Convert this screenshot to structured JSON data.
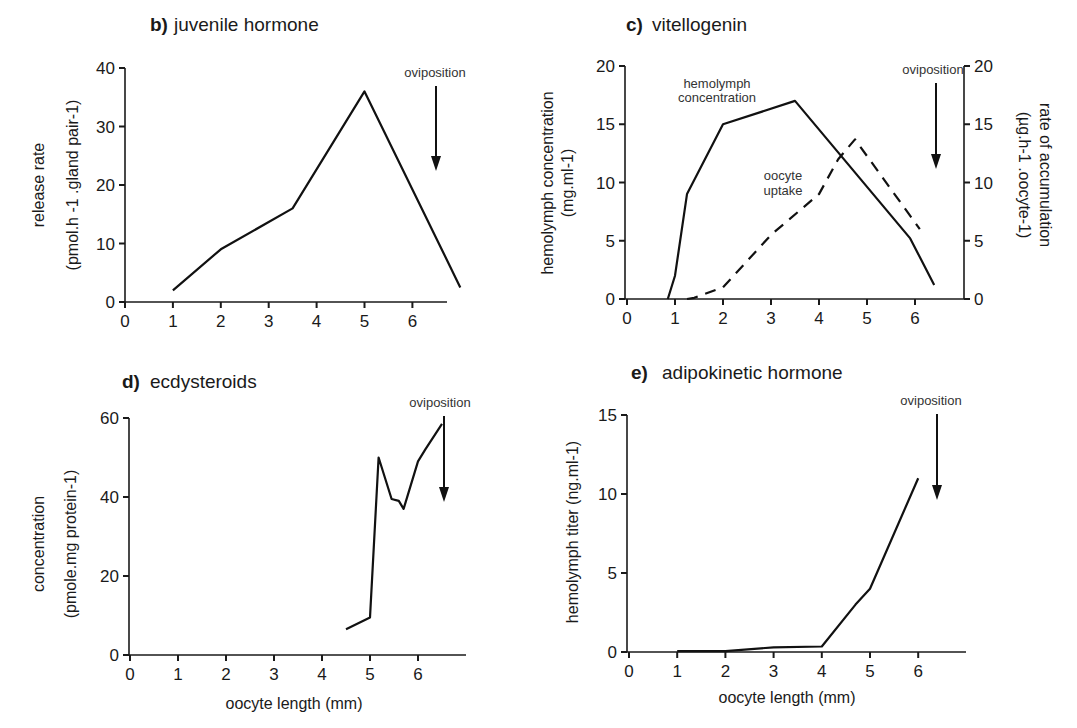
{
  "figure": {
    "annotation_label": "oviposition",
    "xlabel": "oocyte length (mm)"
  },
  "chart_data": [
    {
      "id": "b",
      "type": "line",
      "panel_letter": "b)",
      "title": "juvenile hormone",
      "xlabel": "",
      "ylabel": "release rate",
      "ylabel2": "(pmol.h -1 .gland pair-1)",
      "xticks": [
        0,
        1,
        2,
        3,
        4,
        5,
        6
      ],
      "yticks": [
        0,
        10,
        20,
        30,
        40
      ],
      "xlim": [
        0,
        7
      ],
      "ylim": [
        0,
        40
      ],
      "annotations": [
        {
          "text": "oviposition",
          "type": "arrow-down",
          "x": 6.5
        }
      ],
      "series": [
        {
          "name": "juvenile hormone release rate",
          "style": "solid",
          "x": [
            1,
            2,
            3.5,
            5,
            7
          ],
          "y": [
            2,
            9,
            16,
            36,
            2.5
          ]
        }
      ]
    },
    {
      "id": "c",
      "type": "line",
      "panel_letter": "c)",
      "title": "vitellogenin",
      "xlabel": "",
      "ylabel": "hemolymph concentration",
      "ylabel2": "(mg.ml-1)",
      "y2label": "rate of accumulation",
      "y2label2": "(µg.h-1 .oocyte-1)",
      "xticks": [
        0,
        1,
        2,
        3,
        4,
        5,
        6
      ],
      "yticks": [
        0,
        5,
        10,
        15,
        20
      ],
      "y2ticks": [
        0,
        5,
        10,
        15,
        20
      ],
      "xlim": [
        0,
        7
      ],
      "ylim": [
        0,
        20
      ],
      "y2lim": [
        0,
        20
      ],
      "annotations": [
        {
          "text": "oviposition",
          "type": "arrow-down",
          "x": 6.4
        },
        {
          "text": "hemolymph concentration",
          "type": "series-label"
        },
        {
          "text": "oocyte uptake",
          "type": "series-label"
        }
      ],
      "series": [
        {
          "name": "hemolymph concentration",
          "style": "solid",
          "axis": "left",
          "x": [
            0.85,
            1.0,
            1.25,
            2.0,
            3.5,
            5.9,
            6.4
          ],
          "y": [
            0,
            2,
            9,
            15,
            17,
            5.2,
            1.2
          ]
        },
        {
          "name": "oocyte uptake",
          "style": "dashed",
          "axis": "right",
          "x": [
            1.25,
            1.4,
            2.0,
            3.0,
            4.0,
            4.4,
            4.75,
            6.1
          ],
          "y": [
            0,
            0.1,
            1,
            5.5,
            9,
            12,
            13.7,
            6
          ]
        }
      ]
    },
    {
      "id": "d",
      "type": "line",
      "panel_letter": "d)",
      "title": "ecdysteroids",
      "xlabel": "oocyte length (mm)",
      "ylabel": "concentration",
      "ylabel2": "(pmole.mg protein-1)",
      "xticks": [
        0,
        1,
        2,
        3,
        4,
        5,
        6
      ],
      "yticks": [
        0,
        20,
        40,
        60
      ],
      "xlim": [
        0,
        7
      ],
      "ylim": [
        0,
        60
      ],
      "annotations": [
        {
          "text": "oviposition",
          "type": "arrow-down",
          "x": 6.55
        }
      ],
      "series": [
        {
          "name": "ecdysteroid concentration",
          "style": "solid",
          "x": [
            4.5,
            5.0,
            5.18,
            5.45,
            5.6,
            5.7,
            6.0,
            6.15,
            6.5
          ],
          "y": [
            6.5,
            9.5,
            50,
            39.5,
            39,
            37,
            49,
            52,
            58.5
          ]
        }
      ]
    },
    {
      "id": "e",
      "type": "line",
      "panel_letter": "e)",
      "title": "adipokinetic hormone",
      "xlabel": "oocyte length (mm)",
      "ylabel": "hemolymph titer (ng.ml-1)",
      "xticks": [
        0,
        1,
        2,
        3,
        4,
        5,
        6
      ],
      "yticks": [
        0,
        5,
        10,
        15
      ],
      "xlim": [
        0,
        7
      ],
      "ylim": [
        0,
        15
      ],
      "annotations": [
        {
          "text": "oviposition",
          "type": "arrow-down",
          "x": 6.4
        }
      ],
      "series": [
        {
          "name": "adipokinetic hormone titer",
          "style": "solid",
          "x": [
            1,
            2,
            3,
            4,
            4.7,
            5,
            6
          ],
          "y": [
            0.05,
            0.05,
            0.3,
            0.35,
            3,
            4,
            11
          ]
        }
      ]
    }
  ]
}
